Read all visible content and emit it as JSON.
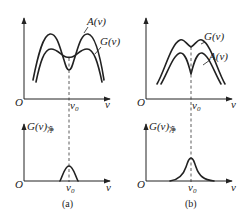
{
  "figure": {
    "panels": [
      {
        "id": "a",
        "caption": "(a)",
        "top_graph": {
          "origin_label": "O",
          "x_axis_label": "ν",
          "tick_label": "ν",
          "tick_sub": "0",
          "curves": [
            {
              "name": "A(ν)",
              "label": "A(ν)",
              "shape": "double-peaked, deep central dip at ν0, outer (taller) curve"
            },
            {
              "name": "G(ν)",
              "label": "G(ν)",
              "shape": "double-peaked, shallow central dip at ν0, inner (lower) curve"
            }
          ]
        },
        "bottom_graph": {
          "origin_label": "O",
          "x_axis_label": "ν",
          "y_axis_label": "G(ν)",
          "y_axis_sub": "净",
          "tick_label": "ν",
          "tick_sub": "0",
          "shape": "narrow peak centered at ν0"
        }
      },
      {
        "id": "b",
        "caption": "(b)",
        "top_graph": {
          "origin_label": "O",
          "x_axis_label": "ν",
          "tick_label": "ν",
          "tick_sub": "0",
          "curves": [
            {
              "name": "G(ν)",
              "label": "G(ν)",
              "shape": "double-peaked, small central dip at ν0, upper curve"
            },
            {
              "name": "A(ν)",
              "label": "A(ν)",
              "shape": "double-peaked, deep central dip at ν0, lower curve"
            }
          ]
        },
        "bottom_graph": {
          "origin_label": "O",
          "x_axis_label": "ν",
          "y_axis_label": "G(ν)",
          "y_axis_sub": "净",
          "tick_label": "ν",
          "tick_sub": "0",
          "shape": "broad peak centered at ν0"
        }
      }
    ]
  }
}
